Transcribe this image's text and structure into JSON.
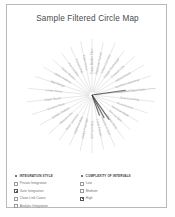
{
  "page": {
    "title": "Sample Filtered Circle Map",
    "background_color": "#ffffff",
    "frame_color": "#b9b9b9",
    "title_color": "#4a4a4a"
  },
  "chart_data": {
    "type": "scatter",
    "title": "Sample Filtered Circle Map",
    "subtype": "radial-spoke-circle-map",
    "xlabel": "",
    "ylabel": "",
    "grid": false,
    "legend_position": "bottom",
    "center": {
      "x": 84,
      "y": 68
    },
    "spoke_color": "#c9c9c9",
    "label_color": "#a5a5a5",
    "highlight_color": "#3a3a3a",
    "spoke_count": 30,
    "spokes": [
      {
        "label": "Cross Border Flow",
        "angle": -90,
        "length": 56,
        "weight": 1
      },
      {
        "label": "Regional Transit",
        "angle": -78,
        "length": 54,
        "weight": 1
      },
      {
        "label": "Urban Corridor",
        "angle": -66,
        "length": 57,
        "weight": 1
      },
      {
        "label": "Freight Exchange",
        "angle": -54,
        "length": 55,
        "weight": 1
      },
      {
        "label": "Coastal Link",
        "angle": -42,
        "length": 58,
        "weight": 1
      },
      {
        "label": "Inland Route",
        "angle": -30,
        "length": 60,
        "weight": 1
      },
      {
        "label": "Northern Gateway",
        "angle": -18,
        "length": 62,
        "weight": 1
      },
      {
        "label": "Integrated Open Core",
        "angle": -6,
        "length": 64,
        "weight": 2
      },
      {
        "label": "Rail Crossing",
        "angle": 6,
        "length": 63,
        "weight": 1
      },
      {
        "label": "Port Access",
        "angle": 18,
        "length": 58,
        "weight": 1
      },
      {
        "label": "Terminal Node",
        "angle": 30,
        "length": 54,
        "weight": 1
      },
      {
        "label": "Service Belt",
        "angle": 42,
        "length": 52,
        "weight": 1
      },
      {
        "label": "Market Ring",
        "angle": 54,
        "length": 55,
        "weight": 1
      },
      {
        "label": "Southern Spur",
        "angle": 66,
        "length": 57,
        "weight": 1
      },
      {
        "label": "Local Feeder",
        "angle": 78,
        "length": 56,
        "weight": 1
      },
      {
        "label": "Interior Loop",
        "angle": 90,
        "length": 58,
        "weight": 1
      },
      {
        "label": "Valley Passage",
        "angle": 102,
        "length": 57,
        "weight": 1
      },
      {
        "label": "Highland Way",
        "angle": 114,
        "length": 55,
        "weight": 1
      },
      {
        "label": "River Junction",
        "angle": 126,
        "length": 56,
        "weight": 1
      },
      {
        "label": "Western Arc",
        "angle": 138,
        "length": 58,
        "weight": 1
      },
      {
        "label": "Border Station",
        "angle": 150,
        "length": 60,
        "weight": 1
      },
      {
        "label": "Central Plain",
        "angle": 162,
        "length": 63,
        "weight": 1
      },
      {
        "label": "Upper Basin",
        "angle": 174,
        "length": 66,
        "weight": 1
      },
      {
        "label": "Lower Basin",
        "angle": 186,
        "length": 64,
        "weight": 1
      },
      {
        "label": "Mid Range",
        "angle": 198,
        "length": 60,
        "weight": 1
      },
      {
        "label": "Open Plateau",
        "angle": 210,
        "length": 56,
        "weight": 1
      },
      {
        "label": "Outer Reach",
        "angle": 222,
        "length": 53,
        "weight": 1
      },
      {
        "label": "Far Corridor",
        "angle": 234,
        "length": 52,
        "weight": 1
      },
      {
        "label": "Transit Hub",
        "angle": 246,
        "length": 53,
        "weight": 1
      },
      {
        "label": "Main Artery",
        "angle": 258,
        "length": 55,
        "weight": 1
      }
    ],
    "highlight_edges": [
      {
        "angle": -8,
        "length": 34
      },
      {
        "angle": 55,
        "length": 30
      },
      {
        "angle": 62,
        "length": 26
      },
      {
        "angle": 70,
        "length": 22
      }
    ]
  },
  "legend": {
    "integration_style": {
      "header": "INTEGRATION STYLE",
      "items": [
        {
          "label": "Private Integration",
          "checked": false
        },
        {
          "label": "Gate Integration",
          "checked": true
        },
        {
          "label": "Clean Link Cases",
          "checked": false
        },
        {
          "label": "Analytic Integration",
          "checked": false
        }
      ]
    },
    "complexity_of_intervals": {
      "header": "COMPLEXITY OF INTERVALS",
      "items": [
        {
          "label": "Low",
          "checked": false
        },
        {
          "label": "Medium",
          "checked": false
        },
        {
          "label": "High",
          "checked": true
        }
      ]
    }
  }
}
